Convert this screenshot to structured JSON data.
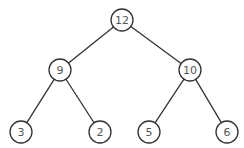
{
  "diagram": {
    "type": "binary-tree",
    "colors": {
      "stroke": "#333333",
      "label": "#555555",
      "fill": "#ffffff",
      "background": "#ffffff"
    },
    "node_radius": 11,
    "nodes": [
      {
        "id": "n12",
        "label": "12",
        "x": 122,
        "y": 20
      },
      {
        "id": "n9",
        "label": "9",
        "x": 60,
        "y": 70
      },
      {
        "id": "n10",
        "label": "10",
        "x": 190,
        "y": 70
      },
      {
        "id": "n3",
        "label": "3",
        "x": 21,
        "y": 132
      },
      {
        "id": "n2",
        "label": "2",
        "x": 100,
        "y": 132
      },
      {
        "id": "n5",
        "label": "5",
        "x": 149,
        "y": 132
      },
      {
        "id": "n6",
        "label": "6",
        "x": 227,
        "y": 132
      }
    ],
    "edges": [
      {
        "from": "n12",
        "to": "n9"
      },
      {
        "from": "n12",
        "to": "n10"
      },
      {
        "from": "n9",
        "to": "n3"
      },
      {
        "from": "n9",
        "to": "n2"
      },
      {
        "from": "n10",
        "to": "n5"
      },
      {
        "from": "n10",
        "to": "n6"
      }
    ]
  }
}
